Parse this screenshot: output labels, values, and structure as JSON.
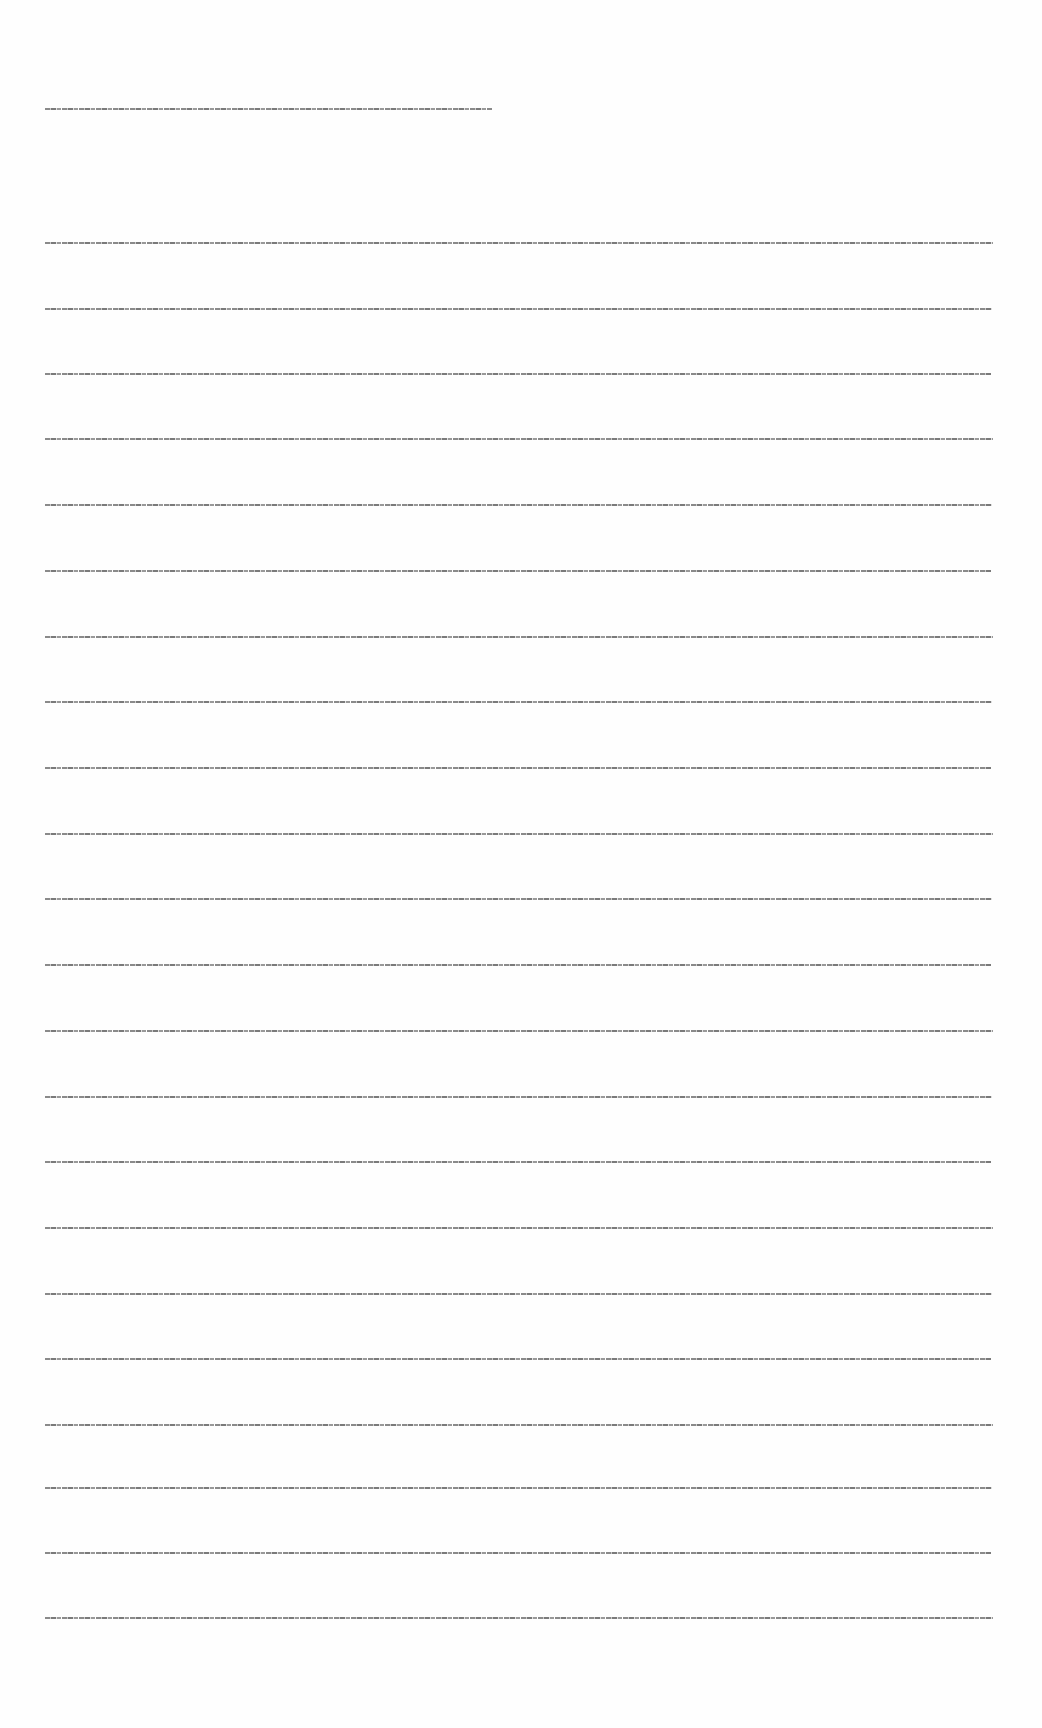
{
  "document": {
    "header_line": {
      "text": "[illegible micro-text header line]",
      "top": 108,
      "width": 447
    },
    "lines": [
      {
        "text": "[illegible micro-text line 1]",
        "top": 242
      },
      {
        "text": "[illegible micro-text line 2]",
        "top": 308
      },
      {
        "text": "[illegible micro-text line 3]",
        "top": 373
      },
      {
        "text": "[illegible micro-text line 4]",
        "top": 438
      },
      {
        "text": "[illegible micro-text line 5]",
        "top": 504
      },
      {
        "text": "[illegible micro-text line 6]",
        "top": 570
      },
      {
        "text": "[illegible micro-text line 7]",
        "top": 636
      },
      {
        "text": "[illegible micro-text line 8]",
        "top": 701
      },
      {
        "text": "[illegible micro-text line 9]",
        "top": 767
      },
      {
        "text": "[illegible micro-text line 10]",
        "top": 833
      },
      {
        "text": "[illegible micro-text line 11]",
        "top": 898
      },
      {
        "text": "[illegible micro-text line 12]",
        "top": 964
      },
      {
        "text": "[illegible micro-text line 13]",
        "top": 1030
      },
      {
        "text": "[illegible micro-text line 14]",
        "top": 1096
      },
      {
        "text": "[illegible micro-text line 15]",
        "top": 1161
      },
      {
        "text": "[illegible micro-text line 16]",
        "top": 1227
      },
      {
        "text": "[illegible micro-text line 17]",
        "top": 1293
      },
      {
        "text": "[illegible micro-text line 18]",
        "top": 1358
      },
      {
        "text": "[illegible micro-text line 19]",
        "top": 1424
      },
      {
        "text": "[illegible micro-text line 20]",
        "top": 1487
      },
      {
        "text": "[illegible micro-text line 21]",
        "top": 1552
      },
      {
        "text": "[illegible micro-text line 22]",
        "top": 1617
      }
    ]
  }
}
